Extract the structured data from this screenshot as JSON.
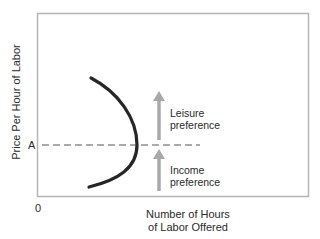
{
  "diagram": {
    "y_axis_label": "Price Per Hour of Labor",
    "x_axis_label_line1": "Number of Hours",
    "x_axis_label_line2": "of Labor Offered",
    "origin_label": "0",
    "price_level_label": "A",
    "upper_arrow_label_line1": "Leisure",
    "upper_arrow_label_line2": "preference",
    "lower_arrow_label_line1": "Income",
    "lower_arrow_label_line2": "preference",
    "colors": {
      "frame": "#b5b5b5",
      "curve": "#262626",
      "arrows": "#a8a8a8",
      "dashed_line": "#555555"
    }
  }
}
